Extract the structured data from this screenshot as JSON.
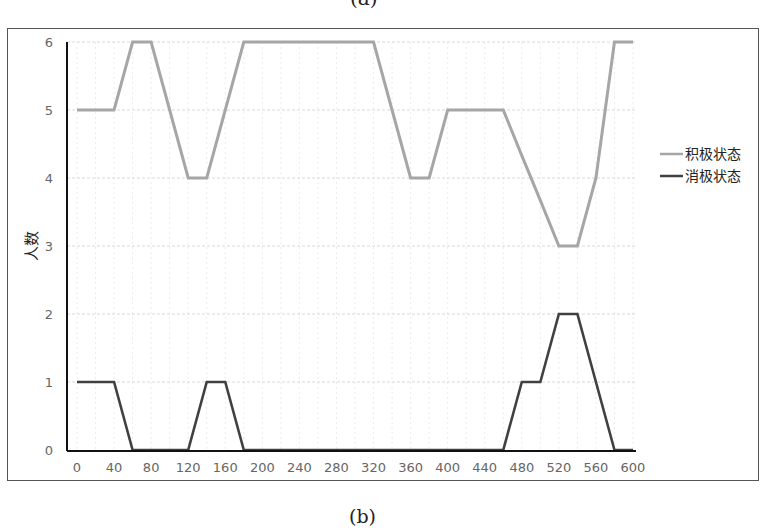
{
  "captions": {
    "top": "(a)",
    "bottom": "(b)"
  },
  "colors": {
    "positive": "#a6a6a6",
    "negative": "#404040",
    "grid": "#d9d9d9",
    "axis": "#111111"
  },
  "chart_data": {
    "type": "line",
    "title": "",
    "xlabel": "",
    "ylabel": "人数",
    "x": [
      0,
      20,
      40,
      60,
      80,
      100,
      120,
      140,
      160,
      180,
      200,
      220,
      240,
      260,
      280,
      300,
      320,
      340,
      360,
      380,
      400,
      420,
      440,
      460,
      480,
      500,
      520,
      540,
      560,
      580,
      600
    ],
    "series": [
      {
        "name": "积极状态",
        "values": [
          5,
          5,
          5,
          6,
          6,
          5,
          4,
          4,
          5,
          6,
          6,
          6,
          6,
          6,
          6,
          6,
          6,
          5,
          4,
          4,
          5,
          5,
          5,
          5,
          4.33,
          3.67,
          3,
          3,
          4,
          6,
          6
        ]
      },
      {
        "name": "消极状态",
        "values": [
          1,
          1,
          1,
          0,
          0,
          0,
          0,
          1,
          1,
          0,
          0,
          0,
          0,
          0,
          0,
          0,
          0,
          0,
          0,
          0,
          0,
          0,
          0,
          0,
          1,
          1,
          2,
          2,
          1,
          0,
          0
        ]
      }
    ],
    "xticks": [
      "0",
      "40",
      "80",
      "120",
      "160",
      "200",
      "240",
      "280",
      "320",
      "360",
      "400",
      "440",
      "480",
      "520",
      "560",
      "600"
    ],
    "yticks": [
      "0",
      "1",
      "2",
      "3",
      "4",
      "5",
      "6"
    ],
    "xlim": [
      0,
      600
    ],
    "ylim": [
      0,
      6
    ],
    "grid": true,
    "legend_position": "right"
  }
}
